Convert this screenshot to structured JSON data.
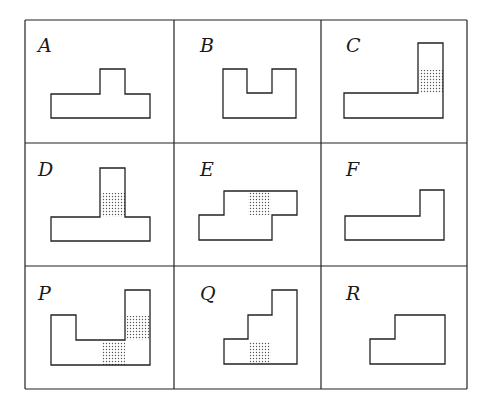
{
  "colors": {
    "line": "#222222",
    "background": "#ffffff",
    "dot": "#555555"
  },
  "grid": {
    "x": [
      25,
      174,
      321,
      467
    ],
    "y": [
      20,
      143,
      266,
      389
    ]
  },
  "cells": [
    {
      "label": "A",
      "lx": 38,
      "ly": 52,
      "shape": "51,118 150,118 150,94 125,94 125,69 100,69 100,94 51,94",
      "shaded": []
    },
    {
      "label": "B",
      "lx": 200,
      "ly": 52,
      "shape": "223,118 296,118 296,69 272,69 272,93 247,93 247,69 223,69",
      "shaded": []
    },
    {
      "label": "C",
      "lx": 346,
      "ly": 52,
      "shape": "344,118 443,118 443,43 418,43 418,93 344,93",
      "shaded": [
        [
          419,
          70,
          24,
          23
        ]
      ]
    },
    {
      "label": "D",
      "lx": 38,
      "ly": 176,
      "shape": "51,241 150,241 150,217 125,217 125,168 100,168 100,217 51,217",
      "shaded": [
        [
          101,
          193,
          24,
          24
        ]
      ]
    },
    {
      "label": "E",
      "lx": 200,
      "ly": 176,
      "shape": "199,240 272,240 272,215 297,215 297,191 224,191 224,215 199,215",
      "shaded": [
        [
          248,
          192,
          23,
          23
        ]
      ]
    },
    {
      "label": "F",
      "lx": 346,
      "ly": 176,
      "shape": "345,240 444,240 444,190 420,190 420,216 345,216",
      "shaded": []
    },
    {
      "label": "P",
      "lx": 38,
      "ly": 300,
      "shape": "51,365 150,365 150,290 125,290 125,340 76,340 76,315 51,315",
      "shaded": [
        [
          127,
          316,
          23,
          24
        ],
        [
          102,
          342,
          23,
          23
        ]
      ]
    },
    {
      "label": "Q",
      "lx": 200,
      "ly": 300,
      "shape": "224,364 297,364 297,290 272,290 272,315 248,315 248,339 224,339",
      "shaded": [
        [
          249,
          342,
          22,
          22
        ]
      ]
    },
    {
      "label": "R",
      "lx": 346,
      "ly": 300,
      "shape": "370,364 445,364 445,315 395,315 395,339 370,339",
      "shaded": []
    }
  ]
}
